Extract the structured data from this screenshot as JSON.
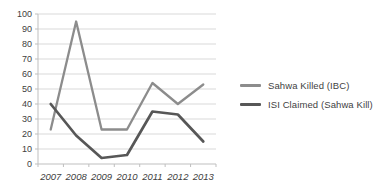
{
  "chart_data": {
    "type": "line",
    "categories": [
      "2007",
      "2008",
      "2009",
      "2010",
      "2011",
      "2012",
      "2013"
    ],
    "series": [
      {
        "name": "Sahwa Killed (IBC)",
        "color": "#8c8c8c",
        "values": [
          23,
          95,
          23,
          23,
          54,
          40,
          53
        ]
      },
      {
        "name": "ISI Claimed (Sahwa Kill)",
        "color": "#575757",
        "values": [
          40,
          19,
          4,
          6,
          35,
          33,
          15
        ]
      }
    ],
    "title": "",
    "xlabel": "",
    "ylabel": "",
    "ylim": [
      0,
      100
    ],
    "ytick_step": 10,
    "yticks": [
      0,
      10,
      20,
      30,
      40,
      50,
      60,
      70,
      80,
      90,
      100
    ],
    "grid": true,
    "legend_position": "right"
  },
  "legend": {
    "items": [
      {
        "label": "Sahwa Killed (IBC)",
        "color": "#8c8c8c"
      },
      {
        "label": "ISI Claimed (Sahwa Kill)",
        "color": "#575757"
      }
    ]
  },
  "colors": {
    "background": "#ffffff",
    "gridline": "#d9d9d9",
    "axis": "#bfbfbf",
    "text": "#404040"
  }
}
